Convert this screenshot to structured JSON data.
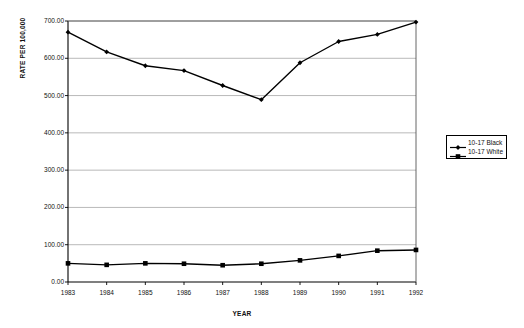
{
  "chart_data": {
    "type": "line",
    "title": "",
    "xlabel": "YEAR",
    "ylabel": "RATE PER 100,000",
    "categories": [
      "1983",
      "1984",
      "1985",
      "1986",
      "1987",
      "1988",
      "1989",
      "1990",
      "1991",
      "1992"
    ],
    "ylim": [
      0,
      700
    ],
    "ytick_labels": [
      "0.00",
      "100.00",
      "200.00",
      "300.00",
      "400.00",
      "500.00",
      "600.00",
      "700.00"
    ],
    "ytick_values": [
      0,
      100,
      200,
      300,
      400,
      500,
      600,
      700
    ],
    "grid": "horizontal",
    "legend_position": "right",
    "series": [
      {
        "name": "10-17 Black",
        "marker": "diamond",
        "color": "#000000",
        "values": [
          670,
          617,
          580,
          567,
          527,
          489,
          588,
          645,
          664,
          697
        ]
      },
      {
        "name": "10-17 White",
        "marker": "square",
        "color": "#000000",
        "values": [
          50,
          46,
          50,
          49,
          45,
          49,
          58,
          70,
          84,
          86
        ]
      }
    ]
  },
  "legend": {
    "items": [
      {
        "label": "10-17 Black"
      },
      {
        "label": "10-17 White"
      }
    ]
  },
  "axes": {
    "y_title": "RATE PER 100,000",
    "x_title": "YEAR"
  }
}
